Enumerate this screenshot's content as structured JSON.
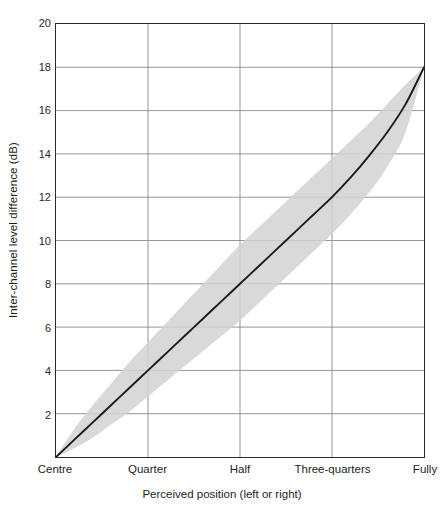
{
  "chart_data": {
    "type": "line",
    "title": "",
    "xlabel": "Perceived position (left or right)",
    "ylabel": "Inter-channel level difference (dB)",
    "x_tick_labels": [
      "Centre",
      "Quarter",
      "Half",
      "Three-quarters",
      "Fully"
    ],
    "x_tick_positions": [
      0,
      0.25,
      0.5,
      0.75,
      1.0
    ],
    "xlim": [
      0,
      1
    ],
    "ylim": [
      0,
      20
    ],
    "y_ticks": [
      2,
      4,
      6,
      8,
      10,
      12,
      14,
      16,
      18,
      20
    ],
    "y_tick_labels": [
      "2",
      "4",
      "6",
      "8",
      "10",
      "12",
      "14",
      "16",
      "18",
      "20"
    ],
    "grid": true,
    "grid_color": "#8a8a8a",
    "legend": "none",
    "series": [
      {
        "name": "Inter-channel level difference",
        "line_color": "#1a1a1a",
        "x": [
          0.0,
          0.05,
          0.1,
          0.15,
          0.2,
          0.25,
          0.3,
          0.35,
          0.4,
          0.45,
          0.5,
          0.55,
          0.6,
          0.65,
          0.7,
          0.75,
          0.8,
          0.85,
          0.9,
          0.95,
          1.0
        ],
        "values": [
          0.0,
          0.8,
          1.6,
          2.4,
          3.2,
          4.0,
          4.8,
          5.6,
          6.4,
          7.2,
          8.0,
          8.8,
          9.6,
          10.4,
          11.2,
          12.0,
          12.9,
          13.9,
          15.0,
          16.3,
          18.0
        ]
      }
    ],
    "band": {
      "name": "Tolerance range",
      "fill_color": "#d0d0d0",
      "x": [
        0.0,
        0.05,
        0.1,
        0.15,
        0.2,
        0.25,
        0.3,
        0.35,
        0.4,
        0.45,
        0.5,
        0.55,
        0.6,
        0.65,
        0.7,
        0.75,
        0.8,
        0.85,
        0.9,
        0.95,
        1.0
      ],
      "upper": [
        0.0,
        1.3,
        2.4,
        3.4,
        4.4,
        5.3,
        6.2,
        7.1,
        8.0,
        8.9,
        9.8,
        10.6,
        11.4,
        12.2,
        13.0,
        13.8,
        14.6,
        15.4,
        16.3,
        17.2,
        18.0
      ],
      "lower": [
        0.0,
        0.4,
        0.9,
        1.5,
        2.1,
        2.8,
        3.5,
        4.2,
        4.9,
        5.6,
        6.3,
        7.1,
        7.9,
        8.7,
        9.5,
        10.3,
        11.2,
        12.2,
        13.4,
        15.0,
        18.0
      ]
    },
    "annotations": []
  }
}
